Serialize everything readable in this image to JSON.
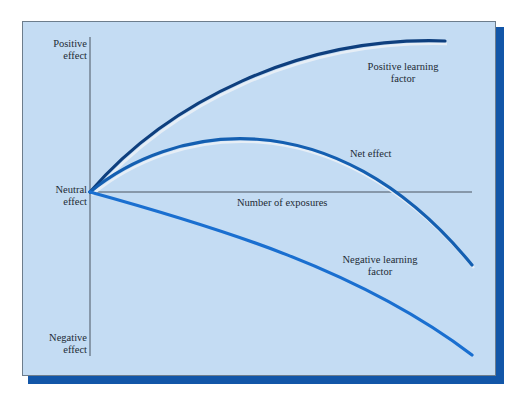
{
  "diagram": {
    "y_axis_labels": {
      "top": [
        "Positive",
        "effect"
      ],
      "middle": [
        "Neutral",
        "effect"
      ],
      "bottom": [
        "Negative",
        "effect"
      ]
    },
    "x_axis_label": "Number of exposures",
    "curves": [
      {
        "name": "Positive learning factor",
        "label_lines": [
          "Positive learning",
          "factor"
        ],
        "color": "#0e3f7e"
      },
      {
        "name": "Net effect",
        "label_lines": [
          "Net effect"
        ],
        "color": "#145fb1"
      },
      {
        "name": "Negative learning factor",
        "label_lines": [
          "Negative learning",
          "factor"
        ],
        "color": "#1a6fd0"
      }
    ],
    "colors": {
      "panel_background": "#c4dcf3",
      "panel_shadow": "#1256a8",
      "axis": "#4a5560"
    }
  }
}
